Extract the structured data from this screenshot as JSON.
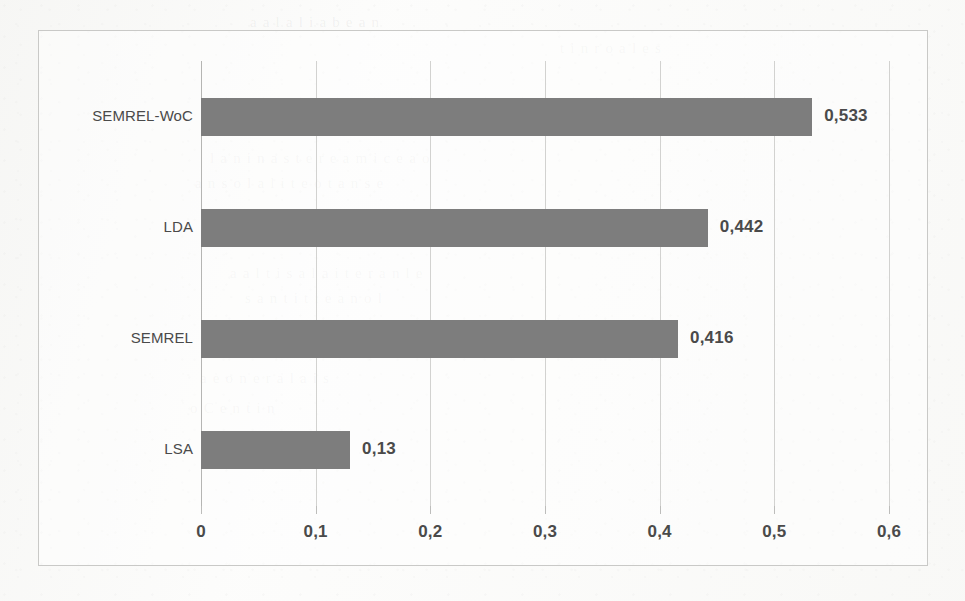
{
  "chart_data": {
    "type": "bar",
    "orientation": "horizontal",
    "title": "",
    "subtitle": "",
    "xlabel": "",
    "ylabel": "",
    "categories": [
      "SEMREL-WoC",
      "LDA",
      "SEMREL",
      "LSA"
    ],
    "values": [
      0.533,
      0.442,
      0.416,
      0.13
    ],
    "value_labels": [
      "0,533",
      "0,442",
      "0,416",
      "0,13"
    ],
    "xlim": [
      0,
      0.6
    ],
    "xticks": [
      0,
      0.1,
      0.2,
      0.3,
      0.4,
      0.5,
      0.6
    ],
    "xtick_labels": [
      "0",
      "0,1",
      "0,2",
      "0,3",
      "0,4",
      "0,5",
      "0,6"
    ],
    "decimal_separator": ",",
    "grid": "vertical",
    "legend": "none",
    "series": [
      {
        "name": "",
        "color": "#7d7d7d",
        "values": [
          0.533,
          0.442,
          0.416,
          0.13
        ]
      }
    ],
    "colors": {
      "bar": "#7d7d7d",
      "gridline": "#d2d2d0",
      "axis": "#b5b5b3",
      "text": "#4a4a4a",
      "frame": "#c9c9c7",
      "background": "#fdfdfc"
    }
  },
  "ghost_text": [
    {
      "text": "a  a  l  a  l  i   a    b  e a n",
      "x": 250,
      "y": 14
    },
    {
      "text": "t    i    n   r  o  a  l  e  s",
      "x": 560,
      "y": 40
    },
    {
      "text": "l a  n   i n a  s  t  e  r  e   a  m  i c  e   a  o",
      "x": 210,
      "y": 150
    },
    {
      "text": "a   n  s  o l  a  l   i  t  e   o  t   a  n   s  e",
      "x": 195,
      "y": 175
    },
    {
      "text": "a  a  l  t   i   s  a   l  a  i t  e  r   a  n  l   e",
      "x": 230,
      "y": 265
    },
    {
      "text": "s  a  n   t  i  t   i  e   a  n  o  l",
      "x": 245,
      "y": 290
    },
    {
      "text": "a  e  o  n   e  r  a  l   a  i  s",
      "x": 200,
      "y": 370
    },
    {
      "text": "o  C   e  n  t  i  n",
      "x": 190,
      "y": 400
    },
    {
      "text": "e  n  s  t  a  i  l    e  o   a  t",
      "x": 215,
      "y": 440
    }
  ]
}
